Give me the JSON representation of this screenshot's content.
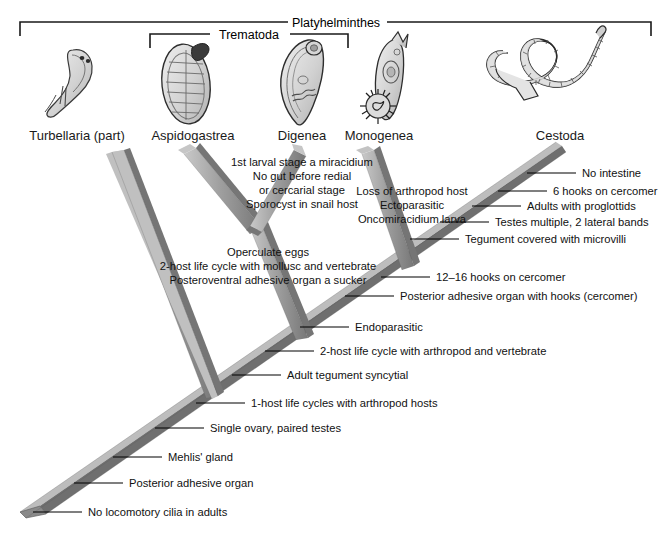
{
  "figure": {
    "type": "cladogram",
    "title_brackets": [
      {
        "name": "platyhelminthes-bracket",
        "label": "Platyhelminthes",
        "x1": 20,
        "x2": 651,
        "y": 22,
        "label_x": 336
      },
      {
        "name": "trematoda-bracket",
        "label": "Trematoda",
        "x1": 150,
        "x2": 348,
        "y": 34,
        "label_x": 249
      }
    ],
    "taxa": [
      {
        "id": "turbellaria",
        "label": "Turbellaria (part)",
        "x": 77,
        "y": 136,
        "tip_x": 118,
        "tip_y": 152
      },
      {
        "id": "aspidogastrea",
        "label": "Aspidogastrea",
        "x": 193,
        "y": 136,
        "tip_x": 190,
        "tip_y": 152
      },
      {
        "id": "digenea",
        "label": "Digenea",
        "x": 302,
        "y": 136,
        "tip_x": 300,
        "tip_y": 152
      },
      {
        "id": "monogenea",
        "label": "Monogenea",
        "x": 377,
        "y": 136,
        "tip_x": 368,
        "tip_y": 152
      },
      {
        "id": "cestoda",
        "label": "Cestoda",
        "x": 560,
        "y": 136,
        "tip_x": 555,
        "tip_y": 152
      }
    ],
    "nodes": [
      {
        "id": "trematoda-node",
        "x": 256,
        "y": 230
      },
      {
        "id": "monogenea-cestoda-node",
        "x": 408,
        "y": 266
      },
      {
        "id": "neodermata-base",
        "x": 300,
        "y": 336
      },
      {
        "id": "root-node",
        "x": 208,
        "y": 392
      },
      {
        "id": "root-tip",
        "x": 33,
        "y": 512
      }
    ],
    "characters": [
      {
        "id": "no-intestine",
        "label": "No intestine",
        "tick_x1": 527,
        "tick_x2": 576,
        "y": 173,
        "text_x": 582,
        "align": "start"
      },
      {
        "id": "six-hooks-cercomer",
        "label": "6 hooks on cercomer",
        "tick_x1": 498,
        "tick_x2": 547,
        "y": 191,
        "text_x": 553,
        "align": "start"
      },
      {
        "id": "adults-proglottids",
        "label": "Adults with proglottids",
        "tick_x1": 472,
        "tick_x2": 521,
        "y": 205,
        "text_x": 527,
        "align": "start"
      },
      {
        "id": "testes-multiple",
        "label": "Testes multiple, 2 lateral bands",
        "tick_x1": 440,
        "tick_x2": 489,
        "y": 221,
        "text_x": 495,
        "align": "start"
      },
      {
        "id": "tegument-microvilli",
        "label": "Tegument covered with microvilli",
        "tick_x1": 410,
        "tick_x2": 459,
        "y": 238,
        "text_x": 465,
        "align": "start"
      },
      {
        "id": "twelve-sixteen-hooks",
        "label": "12–16 hooks on cercomer",
        "tick_x1": 381,
        "tick_x2": 430,
        "y": 277,
        "text_x": 436,
        "align": "start"
      },
      {
        "id": "posterior-adhesive-cercomer",
        "label": "Posterior adhesive organ with hooks (cercomer)",
        "tick_x1": 345,
        "tick_x2": 394,
        "y": 296,
        "text_x": 400,
        "align": "start"
      },
      {
        "id": "endoparasitic",
        "label": "Endoparasitic",
        "tick_x1": 300,
        "tick_x2": 349,
        "y": 327,
        "text_x": 355,
        "align": "start"
      },
      {
        "id": "two-host-arthropod-vertebrate",
        "label": "2-host life cycle with arthropod and vertebrate",
        "tick_x1": 265,
        "tick_x2": 314,
        "y": 351,
        "text_x": 320,
        "align": "start"
      },
      {
        "id": "adult-tegument-syncytial",
        "label": "Adult tegument syncytial",
        "tick_x1": 232,
        "tick_x2": 281,
        "y": 375,
        "text_x": 287,
        "align": "start"
      },
      {
        "id": "one-host-arthropod",
        "label": "1-host life cycles with arthropod hosts",
        "tick_x1": 196,
        "tick_x2": 245,
        "y": 403,
        "text_x": 251,
        "align": "start"
      },
      {
        "id": "single-ovary",
        "label": "Single ovary, paired testes",
        "tick_x1": 155,
        "tick_x2": 204,
        "y": 428,
        "text_x": 210,
        "align": "start"
      },
      {
        "id": "mehlis-gland",
        "label": "Mehlis' gland",
        "tick_x1": 113,
        "tick_x2": 162,
        "y": 457,
        "text_x": 168,
        "align": "start"
      },
      {
        "id": "posterior-adhesive-organ",
        "label": "Posterior adhesive organ",
        "tick_x1": 74,
        "tick_x2": 123,
        "y": 483,
        "text_x": 129,
        "align": "start"
      },
      {
        "id": "no-locomotory-cilia",
        "label": "No locomotory cilia in adults",
        "tick_x1": 33,
        "tick_x2": 82,
        "y": 512,
        "text_x": 88,
        "align": "start"
      }
    ],
    "character_blocks": [
      {
        "id": "digenea-characters",
        "anchor_x": 302,
        "y": 158,
        "align": "middle",
        "lines": [
          "1st larval stage a miracidium",
          "No gut before redial",
          "or cercarial stage",
          "Sporocyst in snail host"
        ]
      },
      {
        "id": "monogenea-characters",
        "anchor_x": 412,
        "y": 186,
        "align": "middle",
        "lines": [
          "Loss of arthropod host",
          "Ectoparasitic",
          "Oncomiracidium larva"
        ]
      },
      {
        "id": "trematoda-characters",
        "anchor_x": 268,
        "y": 249,
        "align": "middle",
        "lines": [
          "Operculate eggs",
          "2-host life cycle with mollusc and vertebrate",
          "Posteroventral adhesive organ a sucker"
        ]
      }
    ],
    "colors": {
      "branch_face": "#9b9b9b",
      "branch_light": "#c4c4c4",
      "branch_dark": "#6e6e6e",
      "branch_edge": "#5a5a5a",
      "text": "#111111",
      "background": "#ffffff",
      "organism_fill": "#d8d8d8",
      "organism_stroke": "#3a3a3a"
    }
  }
}
